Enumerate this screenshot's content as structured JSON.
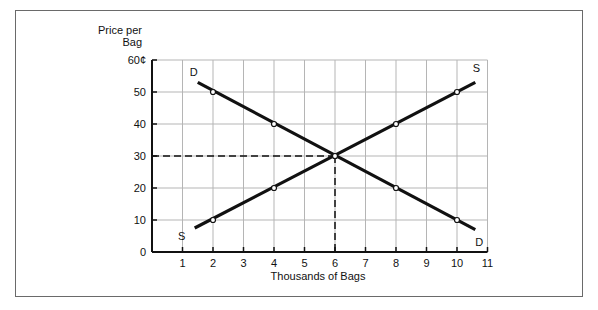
{
  "chart_data": {
    "type": "line",
    "title": "",
    "ylabel_lines": [
      "Price per",
      "Bag"
    ],
    "xlabel": "Thousands of Bags",
    "xlim": [
      0,
      11
    ],
    "ylim": [
      0,
      60
    ],
    "x_ticks": [
      1,
      2,
      3,
      4,
      5,
      6,
      7,
      8,
      9,
      10,
      11
    ],
    "y_ticks": [
      {
        "value": 0,
        "label": "0"
      },
      {
        "value": 10,
        "label": "10"
      },
      {
        "value": 20,
        "label": "20"
      },
      {
        "value": 30,
        "label": "30"
      },
      {
        "value": 40,
        "label": "40"
      },
      {
        "value": 50,
        "label": "50"
      },
      {
        "value": 60,
        "label": "60¢"
      }
    ],
    "grid": true,
    "series": [
      {
        "name": "D",
        "label_start": "D",
        "label_end": "D",
        "line": [
          [
            1.5,
            53
          ],
          [
            10.6,
            7
          ]
        ],
        "points": [
          [
            2,
            50
          ],
          [
            4,
            40
          ],
          [
            6,
            30
          ],
          [
            8,
            20
          ],
          [
            10,
            10
          ]
        ]
      },
      {
        "name": "S",
        "label_start": "S",
        "label_end": "S",
        "line": [
          [
            1.4,
            7.5
          ],
          [
            10.6,
            53
          ]
        ],
        "points": [
          [
            2,
            10
          ],
          [
            4,
            20
          ],
          [
            6,
            30
          ],
          [
            8,
            40
          ],
          [
            10,
            50
          ]
        ]
      }
    ],
    "equilibrium": {
      "x": 6,
      "y": 30
    }
  }
}
